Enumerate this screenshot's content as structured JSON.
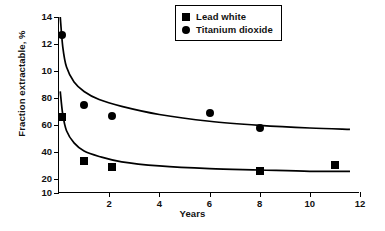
{
  "chart_data": {
    "type": "scatter",
    "title": "",
    "xlabel": "Years",
    "ylabel": "Fraction extractable, %",
    "xlim": [
      0,
      12
    ],
    "ylim": [
      10,
      140
    ],
    "grid": false,
    "legend_position": "top-right",
    "x_tick_labels": [
      "2",
      "4",
      "6",
      "8",
      "10",
      "12"
    ],
    "x_tick_values": [
      2,
      4,
      6,
      8,
      10,
      12
    ],
    "y_tick_labels": [
      "14",
      "12",
      "10",
      "80",
      "60",
      "40",
      "20",
      "10"
    ],
    "y_tick_values": [
      140,
      120,
      100,
      80,
      60,
      40,
      20,
      10
    ],
    "series": [
      {
        "name": "Titanium dioxide",
        "marker": "circle",
        "points": [
          {
            "x": 0.12,
            "y": 127
          },
          {
            "x": 1.0,
            "y": 75
          },
          {
            "x": 2.1,
            "y": 67
          },
          {
            "x": 6.0,
            "y": 69
          },
          {
            "x": 8.0,
            "y": 58
          }
        ],
        "fit_curve": [
          {
            "x": 0.05,
            "y": 140
          },
          {
            "x": 0.15,
            "y": 118
          },
          {
            "x": 0.3,
            "y": 103
          },
          {
            "x": 0.6,
            "y": 92
          },
          {
            "x": 1.0,
            "y": 85
          },
          {
            "x": 1.6,
            "y": 79
          },
          {
            "x": 2.5,
            "y": 74
          },
          {
            "x": 4.0,
            "y": 68
          },
          {
            "x": 6.0,
            "y": 63
          },
          {
            "x": 8.0,
            "y": 60
          },
          {
            "x": 10.0,
            "y": 58
          },
          {
            "x": 11.6,
            "y": 57
          }
        ]
      },
      {
        "name": "Lead white",
        "marker": "square",
        "points": [
          {
            "x": 0.12,
            "y": 66
          },
          {
            "x": 1.0,
            "y": 34
          },
          {
            "x": 2.1,
            "y": 29
          },
          {
            "x": 8.0,
            "y": 26
          },
          {
            "x": 11.0,
            "y": 31
          }
        ],
        "fit_curve": [
          {
            "x": 0.05,
            "y": 85
          },
          {
            "x": 0.15,
            "y": 68
          },
          {
            "x": 0.3,
            "y": 56
          },
          {
            "x": 0.6,
            "y": 47
          },
          {
            "x": 1.0,
            "y": 41
          },
          {
            "x": 1.6,
            "y": 37
          },
          {
            "x": 2.5,
            "y": 33
          },
          {
            "x": 4.0,
            "y": 30
          },
          {
            "x": 6.0,
            "y": 28
          },
          {
            "x": 8.0,
            "y": 27
          },
          {
            "x": 10.0,
            "y": 26
          },
          {
            "x": 11.6,
            "y": 26
          }
        ]
      }
    ]
  },
  "legend": {
    "entries": [
      {
        "label": "Lead white",
        "marker": "square"
      },
      {
        "label": "Titanium dioxide",
        "marker": "circle"
      }
    ]
  }
}
